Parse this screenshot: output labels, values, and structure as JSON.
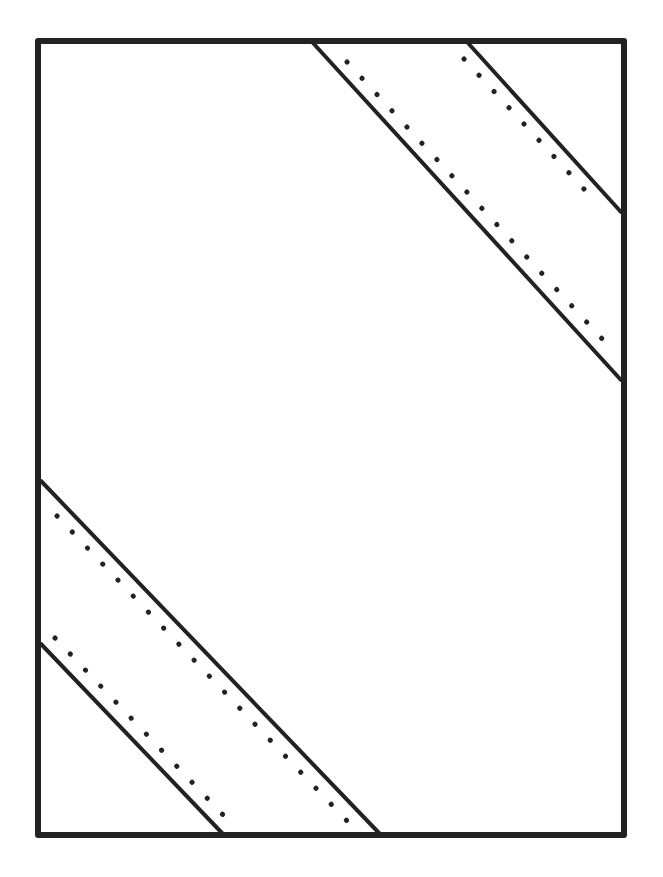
{
  "diagram": {
    "stroke_color": "#222222",
    "background_color": "#ffffff",
    "frame": {
      "x1": 38,
      "y1": 41,
      "x2": 624,
      "y2": 835
    },
    "bands": [
      {
        "name": "top-right-band",
        "solid_lines": [
          {
            "x1": 313,
            "y1": 43,
            "x2": 621,
            "y2": 380
          },
          {
            "x1": 468,
            "y1": 43,
            "x2": 621,
            "y2": 212
          }
        ],
        "dotted_lines": [
          {
            "x1": 347,
            "y1": 62,
            "x2": 606,
            "y2": 343
          },
          {
            "x1": 464,
            "y1": 59,
            "x2": 595,
            "y2": 201
          }
        ]
      },
      {
        "name": "bottom-left-band",
        "solid_lines": [
          {
            "x1": 41,
            "y1": 481,
            "x2": 379,
            "y2": 833
          },
          {
            "x1": 41,
            "y1": 644,
            "x2": 222,
            "y2": 833
          }
        ],
        "dotted_lines": [
          {
            "x1": 57,
            "y1": 516,
            "x2": 349,
            "y2": 823
          },
          {
            "x1": 55,
            "y1": 638,
            "x2": 226,
            "y2": 818
          }
        ]
      }
    ]
  }
}
